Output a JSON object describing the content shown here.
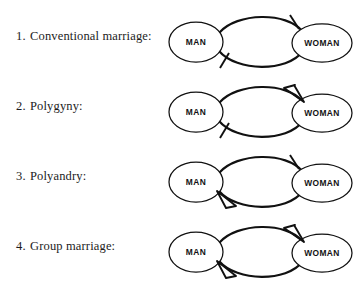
{
  "figure": {
    "background_color": "#ffffff",
    "line_color": "#111111",
    "entity_left_label": "MAN",
    "entity_right_label": "WOMAN",
    "marker_names": {
      "one": "tick-one-marker",
      "many": "crowsfoot-many-marker"
    },
    "rows": [
      {
        "number": "1.",
        "label": "Conventional marriage:",
        "full_label": "1.  Conventional marriage:",
        "left_entity": "MAN",
        "right_entity": "WOMAN",
        "top_arc": {
          "from": "MAN",
          "to": "WOMAN",
          "marker_at_right": "one",
          "marker_at_left": "none"
        },
        "bottom_arc": {
          "from": "WOMAN",
          "to": "MAN",
          "marker_at_left": "one",
          "marker_at_right": "none"
        },
        "cardinality": "one-to-one"
      },
      {
        "number": "2.",
        "label": "Polygyny:",
        "full_label": "2.  Polygyny:",
        "left_entity": "MAN",
        "right_entity": "WOMAN",
        "top_arc": {
          "from": "MAN",
          "to": "WOMAN",
          "marker_at_right": "many",
          "marker_at_left": "none"
        },
        "bottom_arc": {
          "from": "WOMAN",
          "to": "MAN",
          "marker_at_left": "one",
          "marker_at_right": "none"
        },
        "cardinality": "one-man-to-many-women"
      },
      {
        "number": "3.",
        "label": "Polyandry:",
        "full_label": "3.  Polyandry:",
        "left_entity": "MAN",
        "right_entity": "WOMAN",
        "top_arc": {
          "from": "MAN",
          "to": "WOMAN",
          "marker_at_right": "one",
          "marker_at_left": "none"
        },
        "bottom_arc": {
          "from": "WOMAN",
          "to": "MAN",
          "marker_at_left": "many",
          "marker_at_right": "none"
        },
        "cardinality": "one-woman-to-many-men"
      },
      {
        "number": "4.",
        "label": "Group marriage:",
        "full_label": "4.  Group marriage:",
        "left_entity": "MAN",
        "right_entity": "WOMAN",
        "top_arc": {
          "from": "MAN",
          "to": "WOMAN",
          "marker_at_right": "many",
          "marker_at_left": "none"
        },
        "bottom_arc": {
          "from": "WOMAN",
          "to": "MAN",
          "marker_at_left": "many",
          "marker_at_right": "none"
        },
        "cardinality": "many-to-many"
      }
    ]
  }
}
